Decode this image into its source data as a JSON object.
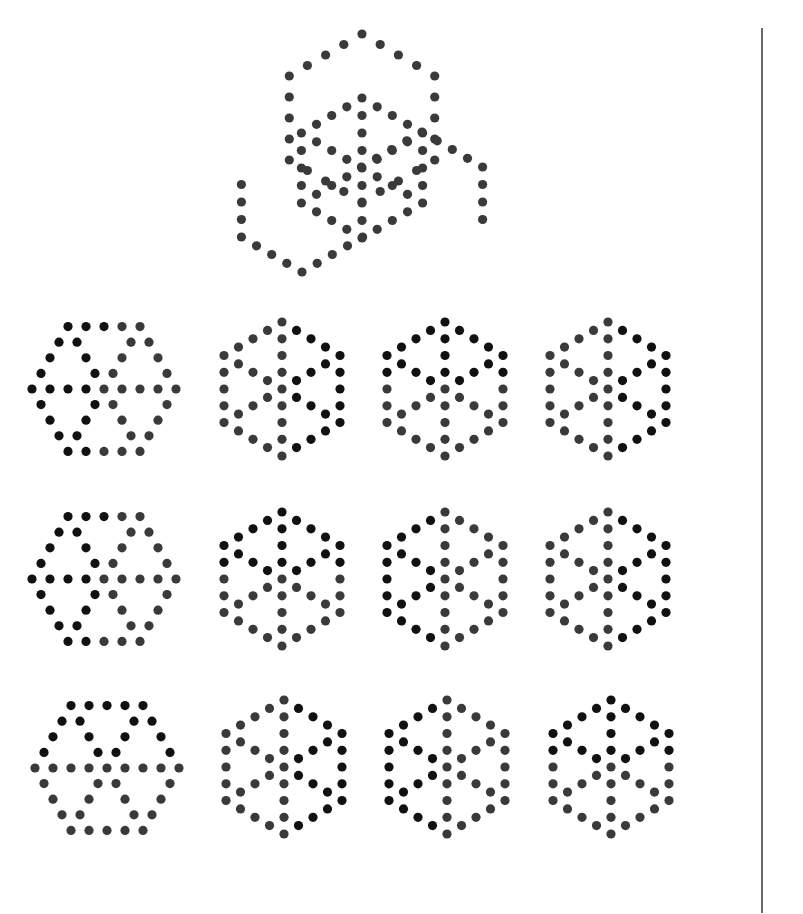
{
  "figure": {
    "colors": {
      "dark": "#111111",
      "gray": "#3a3a3a",
      "background": "#ffffff",
      "divider": "#6a6a6a"
    },
    "dot_radius": 4.6,
    "question": {
      "label": "question-composite",
      "hexes": [
        {
          "cx": 362,
          "cy": 118,
          "R": 84,
          "orientation": "pointy",
          "spokes": false,
          "shade": "gray"
        },
        {
          "cx": 302,
          "cy": 202,
          "R": 70,
          "orientation": "pointy",
          "spokes": false,
          "shade": "gray",
          "partial": "left"
        },
        {
          "cx": 422,
          "cy": 202,
          "R": 70,
          "orientation": "pointy",
          "spokes": false,
          "shade": "gray",
          "partial": "right"
        },
        {
          "cx": 362,
          "cy": 168,
          "R": 70,
          "orientation": "pointy",
          "spokes": true,
          "shade": "gray"
        }
      ]
    },
    "options": [
      {
        "id": 1,
        "cx": 104,
        "cy": 389,
        "R": 72,
        "orientation": "flat"
      },
      {
        "id": 2,
        "cx": 282,
        "cy": 389,
        "R": 67,
        "orientation": "pointy"
      },
      {
        "id": 3,
        "cx": 445,
        "cy": 389,
        "R": 67,
        "orientation": "pointy"
      },
      {
        "id": 4,
        "cx": 608,
        "cy": 389,
        "R": 67,
        "orientation": "pointy"
      },
      {
        "id": 5,
        "cx": 104,
        "cy": 579,
        "R": 72,
        "orientation": "flat"
      },
      {
        "id": 6,
        "cx": 282,
        "cy": 579,
        "R": 67,
        "orientation": "pointy"
      },
      {
        "id": 7,
        "cx": 445,
        "cy": 579,
        "R": 67,
        "orientation": "pointy"
      },
      {
        "id": 8,
        "cx": 608,
        "cy": 579,
        "R": 67,
        "orientation": "pointy"
      },
      {
        "id": 9,
        "cx": 107,
        "cy": 768,
        "R": 72,
        "orientation": "flat"
      },
      {
        "id": 10,
        "cx": 284,
        "cy": 767,
        "R": 67,
        "orientation": "pointy"
      },
      {
        "id": 11,
        "cx": 447,
        "cy": 767,
        "R": 67,
        "orientation": "pointy"
      },
      {
        "id": 12,
        "cx": 611,
        "cy": 767,
        "R": 67,
        "orientation": "pointy"
      }
    ]
  }
}
